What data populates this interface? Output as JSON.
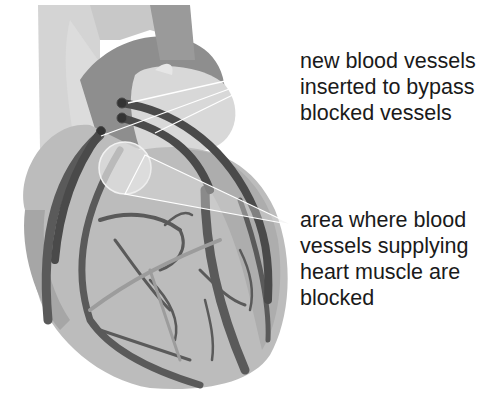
{
  "diagram": {
    "colors": {
      "background": "#ffffff",
      "heart_fill": "#bdbdbd",
      "heart_dark": "#8a8a8a",
      "vessel": "#5a5a5a",
      "graft": "#4a4a4a",
      "aorta_light": "#d6d6d6",
      "pointer_line": "#ffffff",
      "text": "#1a1a1a"
    },
    "labels": [
      {
        "id": "bypass-vessels",
        "lines": [
          "new blood vessels",
          "inserted to bypass",
          "blocked vessels"
        ]
      },
      {
        "id": "blocked-area",
        "lines": [
          "area where blood",
          "vessels supplying",
          "heart muscle are",
          "blocked"
        ]
      }
    ]
  }
}
